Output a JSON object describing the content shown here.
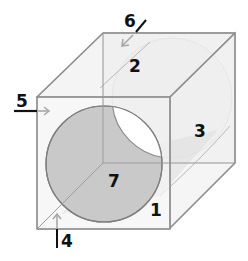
{
  "diagram": {
    "type": "transparent cube with cylindrical bore",
    "colors": {
      "background": "#ffffff",
      "cube_face": "#ececec",
      "cube_edge": "#9a9a9a",
      "front_disc": "#c8c8c8",
      "back_disc": "#e4e4e4",
      "hole": "#ffffff",
      "arrow_gray": "#a8a8a8",
      "leader_black": "#111111"
    },
    "labels": [
      {
        "id": "1",
        "text": "1"
      },
      {
        "id": "2",
        "text": "2"
      },
      {
        "id": "3",
        "text": "3"
      },
      {
        "id": "4",
        "text": "4"
      },
      {
        "id": "5",
        "text": "5"
      },
      {
        "id": "6",
        "text": "6"
      },
      {
        "id": "7",
        "text": "7"
      }
    ]
  }
}
